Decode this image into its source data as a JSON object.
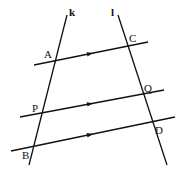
{
  "diagram": {
    "type": "geometry",
    "colors": {
      "stroke": "#111111",
      "background": "#ffffff"
    },
    "transversals": [
      {
        "name": "k",
        "label": "k",
        "x1": 67,
        "y1": 15,
        "x2": 29,
        "y2": 165,
        "label_x": 69,
        "label_y": 16
      },
      {
        "name": "l",
        "label": "l",
        "x1": 118,
        "y1": 15,
        "x2": 167,
        "y2": 165,
        "label_x": 111,
        "label_y": 16
      }
    ],
    "parallels": [
      {
        "name": "AC",
        "x1": 34,
        "y1": 65,
        "x2": 148,
        "y2": 42,
        "arrow_x": 90
      },
      {
        "name": "PQ",
        "x1": 20,
        "y1": 117,
        "x2": 164,
        "y2": 90,
        "arrow_x": 90
      },
      {
        "name": "BD",
        "x1": 11,
        "y1": 151,
        "x2": 175,
        "y2": 117,
        "arrow_x": 90
      }
    ],
    "points": [
      {
        "label": "A",
        "x": 54,
        "y": 60,
        "label_x": 44,
        "label_y": 58
      },
      {
        "label": "C",
        "x": 128,
        "y": 46,
        "label_x": 129,
        "label_y": 42
      },
      {
        "label": "P",
        "x": 41,
        "y": 113,
        "label_x": 32,
        "label_y": 112
      },
      {
        "label": "Q",
        "x": 143,
        "y": 95,
        "label_x": 144,
        "label_y": 92
      },
      {
        "label": "B",
        "x": 33,
        "y": 146,
        "label_x": 22,
        "label_y": 159
      },
      {
        "label": "D",
        "x": 153,
        "y": 122,
        "label_x": 155,
        "label_y": 134
      }
    ]
  },
  "labels": {
    "k": "k",
    "l": "l",
    "A": "A",
    "C": "C",
    "P": "P",
    "Q": "Q",
    "B": "B",
    "D": "D"
  }
}
